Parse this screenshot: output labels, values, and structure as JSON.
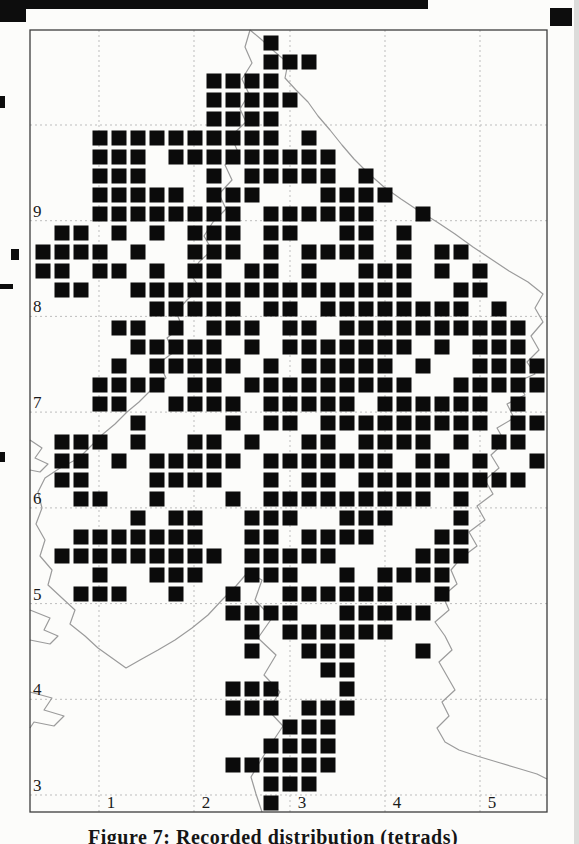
{
  "page": {
    "caption": "Figure 7: Recorded distribution (tetrads)"
  },
  "map": {
    "frame": {
      "x": 30,
      "y": 30,
      "w": 517,
      "h": 782
    },
    "colors": {
      "square": "#0b0b0b",
      "gridline": "#bdbdbd",
      "frame": "#3d3d3d",
      "outline": "#9b9b9b",
      "label": "#1a1a1a",
      "page_edge": "#dcdcda"
    },
    "h_gridlines": [
      125,
      220.7,
      316.4,
      412.1,
      507.9,
      603.6,
      699.3,
      795
    ],
    "v_gridlines": [
      99,
      194,
      290,
      385,
      480
    ],
    "y_axis_labels": [
      {
        "text": "9",
        "line_y": 220.7
      },
      {
        "text": "8",
        "line_y": 316.4
      },
      {
        "text": "7",
        "line_y": 412.1
      },
      {
        "text": "6",
        "line_y": 507.9
      },
      {
        "text": "5",
        "line_y": 603.6
      },
      {
        "text": "4",
        "line_y": 699.3
      },
      {
        "text": "3",
        "line_y": 795
      }
    ],
    "x_axis_labels": [
      {
        "text": "1",
        "line_x": 99
      },
      {
        "text": "2",
        "line_x": 194
      },
      {
        "text": "3",
        "line_x": 290
      },
      {
        "text": "4",
        "line_x": 385
      },
      {
        "text": "5",
        "line_x": 480
      }
    ],
    "grid": {
      "origin_x": 33.5,
      "origin_y": 33.5,
      "pitch": 19,
      "square": 15,
      "cols": 27,
      "rows": 41
    },
    "occupied": {
      "0": [
        12
      ],
      "1": [
        12,
        13,
        14
      ],
      "2": [
        9,
        10,
        11,
        12
      ],
      "3": [
        9,
        10,
        11,
        12,
        13
      ],
      "4": [
        9,
        10,
        11,
        12
      ],
      "5": [
        3,
        4,
        5,
        6,
        7,
        8,
        9,
        10,
        11,
        12,
        14
      ],
      "6": [
        3,
        4,
        5,
        7,
        8,
        9,
        10,
        11,
        12,
        13,
        14,
        15
      ],
      "7": [
        3,
        4,
        5,
        9,
        11,
        12,
        13,
        14,
        15,
        17
      ],
      "8": [
        3,
        4,
        5,
        6,
        7,
        9,
        10,
        11,
        15,
        16,
        17,
        18
      ],
      "9": [
        3,
        4,
        5,
        6,
        7,
        8,
        9,
        10,
        12,
        13,
        14,
        15,
        16,
        17,
        20
      ],
      "10": [
        1,
        2,
        4,
        6,
        8,
        9,
        10,
        12,
        13,
        16,
        17,
        19
      ],
      "11": [
        0,
        1,
        2,
        3,
        5,
        8,
        9,
        10,
        12,
        14,
        15,
        16,
        17,
        19,
        21,
        22
      ],
      "12": [
        0,
        1,
        3,
        4,
        6,
        8,
        9,
        11,
        12,
        14,
        17,
        18,
        19,
        21,
        23
      ],
      "13": [
        1,
        2,
        5,
        6,
        7,
        8,
        9,
        10,
        11,
        12,
        13,
        14,
        15,
        16,
        17,
        18,
        19,
        22,
        23
      ],
      "14": [
        6,
        7,
        8,
        9,
        10,
        12,
        13,
        15,
        16,
        17,
        18,
        19,
        20,
        21,
        22,
        24
      ],
      "15": [
        4,
        5,
        7,
        9,
        10,
        11,
        13,
        14,
        16,
        17,
        18,
        19,
        20,
        21,
        22,
        23,
        24,
        25
      ],
      "16": [
        5,
        6,
        7,
        8,
        9,
        11,
        13,
        14,
        15,
        16,
        17,
        18,
        19,
        21,
        23,
        24,
        25
      ],
      "17": [
        4,
        6,
        7,
        8,
        9,
        10,
        12,
        14,
        15,
        16,
        17,
        18,
        20,
        23,
        24,
        25,
        26
      ],
      "18": [
        3,
        4,
        5,
        6,
        8,
        9,
        11,
        12,
        13,
        14,
        15,
        16,
        17,
        18,
        19,
        22,
        23,
        24,
        25,
        26
      ],
      "19": [
        3,
        4,
        7,
        8,
        9,
        10,
        12,
        13,
        14,
        15,
        16,
        18,
        19,
        20,
        21,
        22,
        23,
        25
      ],
      "20": [
        5,
        10,
        12,
        13,
        15,
        16,
        17,
        18,
        19,
        20,
        21,
        22,
        23,
        25,
        26
      ],
      "21": [
        1,
        2,
        3,
        5,
        8,
        9,
        11,
        14,
        15,
        17,
        18,
        19,
        20,
        22,
        24,
        25
      ],
      "22": [
        1,
        2,
        4,
        6,
        7,
        8,
        9,
        10,
        12,
        13,
        14,
        15,
        16,
        17,
        18,
        20,
        21,
        23,
        26
      ],
      "23": [
        1,
        2,
        6,
        7,
        8,
        9,
        12,
        14,
        15,
        17,
        18,
        19,
        20,
        21,
        22,
        23,
        24,
        25
      ],
      "24": [
        2,
        3,
        6,
        10,
        12,
        13,
        14,
        15,
        16,
        17,
        18,
        19,
        20,
        22
      ],
      "25": [
        5,
        7,
        8,
        11,
        12,
        13,
        16,
        17,
        18,
        22
      ],
      "26": [
        2,
        3,
        4,
        5,
        6,
        7,
        8,
        11,
        12,
        14,
        15,
        16,
        17,
        21,
        22
      ],
      "27": [
        1,
        2,
        3,
        4,
        5,
        6,
        7,
        8,
        9,
        11,
        12,
        13,
        14,
        15,
        20,
        21,
        22
      ],
      "28": [
        3,
        6,
        7,
        8,
        11,
        12,
        13,
        16,
        18,
        19,
        20,
        21
      ],
      "29": [
        2,
        3,
        4,
        7,
        10,
        13,
        14,
        15,
        16,
        17,
        18,
        21
      ],
      "30": [
        10,
        11,
        12,
        13,
        16,
        17,
        18,
        19,
        20
      ],
      "31": [
        11,
        13,
        14,
        15,
        16,
        17,
        18
      ],
      "32": [
        11,
        14,
        15,
        16,
        20
      ],
      "33": [
        15,
        16
      ],
      "34": [
        10,
        11,
        12,
        16
      ],
      "35": [
        10,
        11,
        12,
        14,
        15,
        16
      ],
      "36": [
        13,
        14,
        15
      ],
      "37": [
        12,
        13,
        14,
        15
      ],
      "38": [
        10,
        11,
        12,
        13,
        14,
        15
      ],
      "39": [
        12,
        13,
        14
      ],
      "40": [
        12
      ]
    },
    "outline_paths": [
      "M250 30 L245 47 L252 63 L242 79 L249 94 L240 109 L246 122 L231 136 L238 152 L225 165 L232 180 L219 194 L226 209 L213 222 L204 236 L212 250 L199 262 L191 275 L200 288 L187 300 L176 312 L182 326 L167 338 L174 352 L159 363 L166 378 L151 390 L139 402 L127 412 L115 424 L103 434 L91 446 L79 458 L60 468 L45 478 L38 492 L42 508 L36 524 L45 540 L40 556 L52 570 L48 585 L62 598 L75 610 L70 624 L85 636 L98 648 L112 658 L126 668 L140 660 L158 650 L175 640 L192 628 L208 615 L222 600 L236 586 L248 572 L262 580 L255 600 L272 618 L258 638 L276 655 L264 675 L280 692 L268 710 L283 726 L271 744 L261 760 L251 777 L256 794 L262 812",
      "M250 30 L262 40 L275 52 L288 63 L285 78 L296 90 L308 102 L318 116 L330 130 L342 145 L354 159 L368 173 L384 187 L401 199 L419 211 L437 222 L455 234 L473 247 L491 259 L509 271 L528 282 L543 294 L535 308 L543 322 L531 336 L539 350 L527 362 L535 374 L517 382 L525 395 L507 404 L514 418 L497 428 L505 442 L491 455 L499 468 L485 480 L493 494 L477 506 L485 520 L469 532 L477 546 L461 558 L451 570 L457 584 L443 596 L449 610 L435 622 L445 636 L452 650 L439 662 L447 676 L455 690 L442 702 L449 716 L437 728 L445 742 L459 750 L477 756 L497 762 L517 768 L537 774 L547 779",
      "M30 440 L42 448 L35 458 L48 464 L40 472 L30 470",
      "M30 610 L50 618 L44 630 L58 636 L50 644 L30 640",
      "M30 692 L52 698 L44 710 L64 716 L54 726 L34 722 L30 728"
    ]
  },
  "artifacts": [
    {
      "x": 0,
      "y": 0,
      "w": 26,
      "h": 22
    },
    {
      "x": 18,
      "y": 0,
      "w": 410,
      "h": 9
    },
    {
      "x": 550,
      "y": 8,
      "w": 22,
      "h": 18
    },
    {
      "x": 0,
      "y": 96,
      "w": 5,
      "h": 12
    },
    {
      "x": 11,
      "y": 249,
      "w": 8,
      "h": 11
    },
    {
      "x": 0,
      "y": 284,
      "w": 13,
      "h": 5
    },
    {
      "x": 0,
      "y": 452,
      "w": 5,
      "h": 10
    }
  ]
}
